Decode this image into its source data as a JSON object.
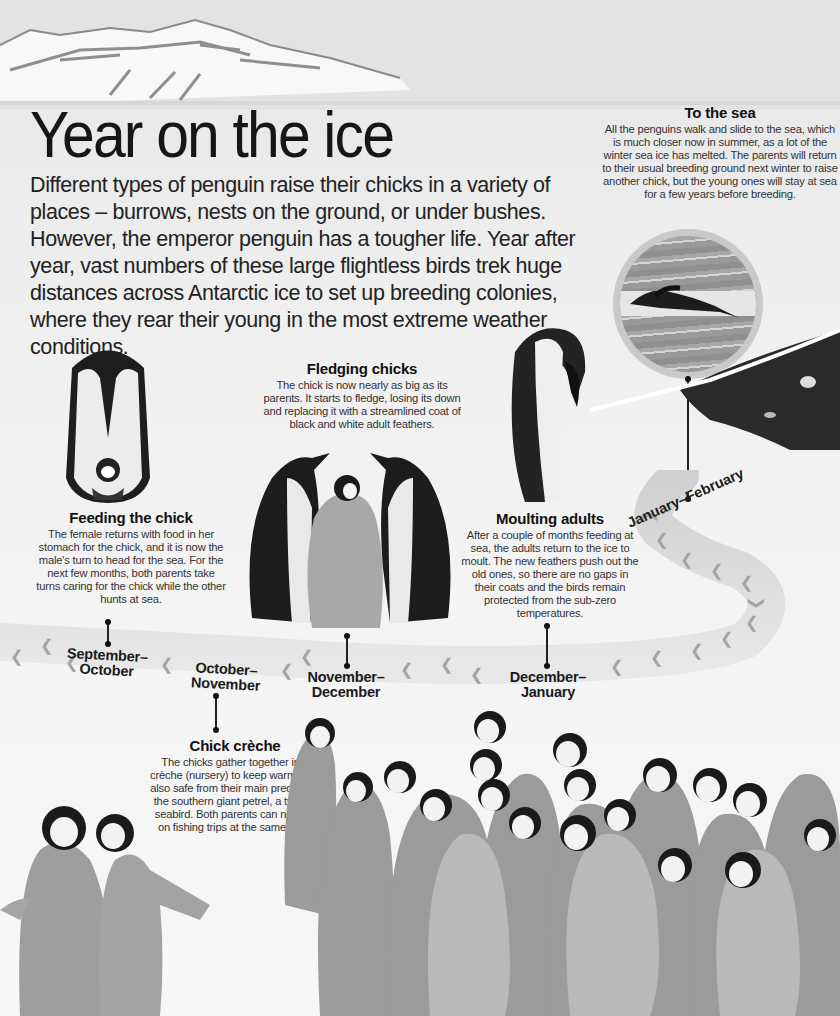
{
  "page": {
    "title": "Year on the ice",
    "intro": "Different types of penguin raise their chicks in a variety of places – burrows, nests on the ground, or under bushes. However, the emperor penguin has a tougher life. Year after year, vast numbers of these large flightless birds trek huge distances across Antarctic ice to set up breeding colonies, where they rear their young in the most extreme weather conditions."
  },
  "stages": {
    "to_the_sea": {
      "heading": "To the sea",
      "body": "All the penguins walk and slide to the sea, which is much closer now in summer, as a lot of the winter sea ice has melted. The parents will return to their usual breeding ground next winter to raise another chick, but the young ones will stay at sea for a few years before breeding.",
      "months": "January–February"
    },
    "fledging": {
      "heading": "Fledging chicks",
      "body": "The chick is now nearly as big as its parents. It starts to fledge, losing its down and replacing it with a streamlined coat of black and white adult feathers.",
      "months_line1": "November–",
      "months_line2": "December"
    },
    "feeding": {
      "heading": "Feeding the chick",
      "body": "The female returns with food in her stomach for the chick, and it is now the male's turn to head for the sea. For the next few months, both parents take turns caring for the chick while the other hunts at sea.",
      "months_line1": "September–",
      "months_line2": "October"
    },
    "moulting": {
      "heading": "Moulting adults",
      "body": "After a couple of months feeding at sea, the adults return to the ice to moult. The new feathers push out the old ones, so there are no gaps in their coats and the birds remain protected from the sub-zero temperatures.",
      "months_line1": "December–",
      "months_line2": "January"
    },
    "creche": {
      "heading": "Chick crèche",
      "body": "The chicks gather together in a crèche (nursery) to keep warm, and also safe from their main predator – the southern giant petrel, a type of seabird. Both parents can now go on fishing trips at the same time.",
      "months_line1": "October–",
      "months_line2": "November"
    }
  },
  "images": {
    "banner": "snowy-mountain-photo",
    "sea_inset": "penguins-diving-from-ice-floe-photo",
    "feeding": "adult-emperor-penguin-with-chick-on-feet-photo",
    "fledging": "two-adults-and-fledging-chick-photo",
    "moulting": "moulting-adult-penguin-photo",
    "creche": "crowd-of-emperor-chicks-photo"
  },
  "colors": {
    "background": "#f2f2f2",
    "text": "#1a1a1a",
    "path": "#d0d0d0",
    "footprints": "#9a9a9a"
  }
}
